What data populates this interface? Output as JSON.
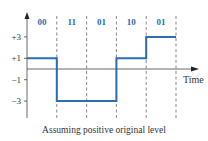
{
  "chart_data": {
    "type": "line",
    "title": "",
    "caption": "Assuming positive original level",
    "xlabel": "Time",
    "ylabel": "",
    "y_ticks": [
      {
        "value": 3,
        "label": "+3"
      },
      {
        "value": 1,
        "label": "+1"
      },
      {
        "value": -1,
        "label": "−1"
      },
      {
        "value": -3,
        "label": "−3"
      }
    ],
    "ylim": [
      -4,
      4.5
    ],
    "segments": [
      {
        "bits": "00",
        "level": 1
      },
      {
        "bits": "11",
        "level": -3
      },
      {
        "bits": "01",
        "level": -3
      },
      {
        "bits": "10",
        "level": 1
      },
      {
        "bits": "01",
        "level": 3
      }
    ],
    "line_color": "#2a6db5",
    "grid": false
  }
}
